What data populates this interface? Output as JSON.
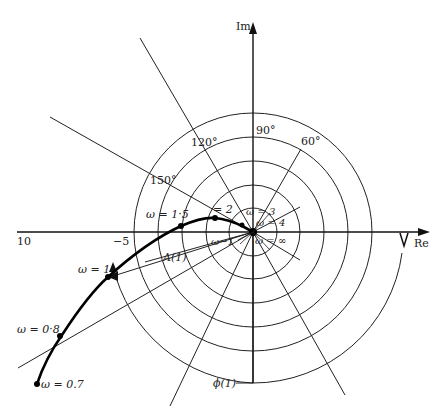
{
  "diagram": {
    "type": "polar (Nyquist) plot",
    "axes": {
      "real_label": "Re",
      "imag_label": "Im"
    },
    "real_ticks": [
      {
        "value": -10,
        "label": "10"
      },
      {
        "value": -5,
        "label": "−5"
      }
    ],
    "angle_labels": [
      "90°",
      "60°",
      "120°",
      "150°"
    ],
    "frequency_points": [
      {
        "label": "ω = 0.7"
      },
      {
        "label": "ω = 0·8"
      },
      {
        "label": "ω = 1"
      },
      {
        "label": "ω = 1·5"
      },
      {
        "label": "= 2"
      },
      {
        "label": "ω = 3"
      },
      {
        "label": "ω = 4"
      },
      {
        "label": "ω = ∞"
      },
      {
        "label": "ω−1"
      }
    ],
    "annotations": {
      "magnitude": "A(1)",
      "phase": "ϕ(1)"
    }
  }
}
